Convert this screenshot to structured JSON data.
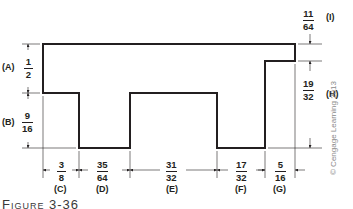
{
  "figure": {
    "caption": "Figure 3-36",
    "copyright": "© Cengage Learning 2013",
    "line_color": "#231f20"
  },
  "dimensions": {
    "A": {
      "label": "(A)",
      "num": "1",
      "den": "2"
    },
    "B": {
      "label": "(B)",
      "num": "9",
      "den": "16"
    },
    "C": {
      "label": "(C)",
      "num": "3",
      "den": "8"
    },
    "D": {
      "label": "(D)",
      "num": "35",
      "den": "64"
    },
    "E": {
      "label": "(E)",
      "num": "31",
      "den": "32"
    },
    "F": {
      "label": "(F)",
      "num": "17",
      "den": "32"
    },
    "G": {
      "label": "(G)",
      "num": "5",
      "den": "16"
    },
    "H": {
      "label": "(H)",
      "num": "19",
      "den": "32"
    },
    "I": {
      "label": "(I)",
      "num": "11",
      "den": "64"
    }
  }
}
